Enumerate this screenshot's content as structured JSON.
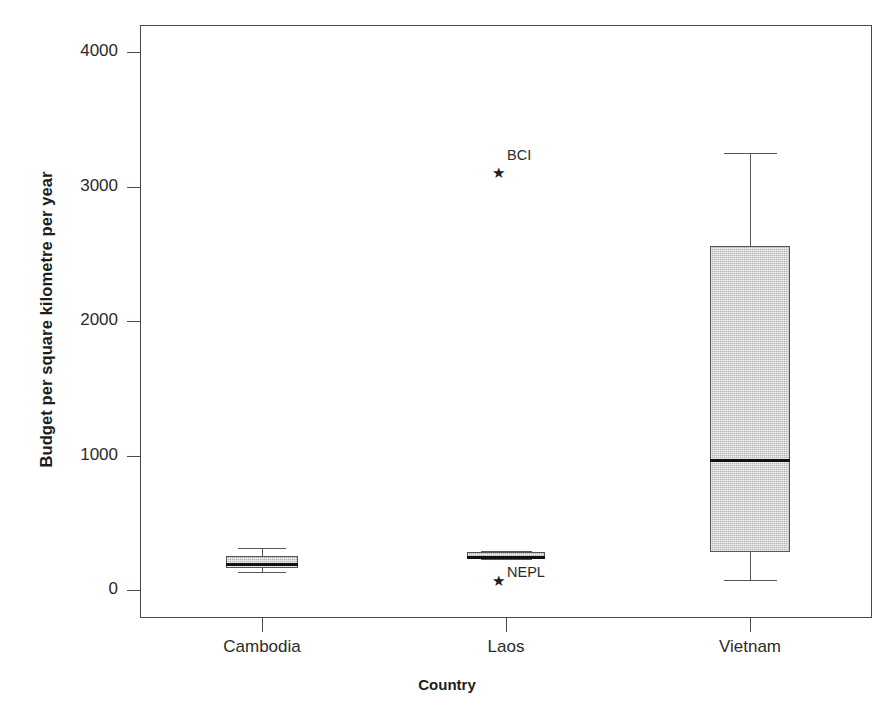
{
  "chart_data": {
    "type": "box",
    "title": "",
    "xlabel": "Country",
    "ylabel": "Budget per square kilometre per year",
    "categories": [
      "Cambodia",
      "Laos",
      "Vietnam"
    ],
    "ylim": [
      0,
      4250
    ],
    "yticks": [
      0,
      1000,
      2000,
      3000,
      4000
    ],
    "ytick_labels": [
      "0",
      "1000",
      "2000",
      "3000",
      "4000"
    ],
    "grid": false,
    "legend": "none",
    "boxes": [
      {
        "category": "Cambodia",
        "whisker_low": 135,
        "q1": 165,
        "median": 200,
        "q3": 255,
        "whisker_high": 310,
        "outliers": []
      },
      {
        "category": "Laos",
        "whisker_low": 230,
        "q1": 235,
        "median": 255,
        "q3": 285,
        "whisker_high": 290,
        "outliers": [
          {
            "label": "NEPL",
            "value": 75
          },
          {
            "label": "BCI",
            "value": 3110
          }
        ]
      },
      {
        "category": "Vietnam",
        "whisker_low": 75,
        "q1": 285,
        "median": 975,
        "q3": 2555,
        "whisker_high": 3250,
        "outliers": []
      }
    ],
    "colors": {
      "box_fill": "#b5b5b5",
      "box_edge": "#555555",
      "median": "#111111",
      "axis": "#4a4a4a",
      "text": "#2b2b2b",
      "background": "#ffffff"
    }
  }
}
